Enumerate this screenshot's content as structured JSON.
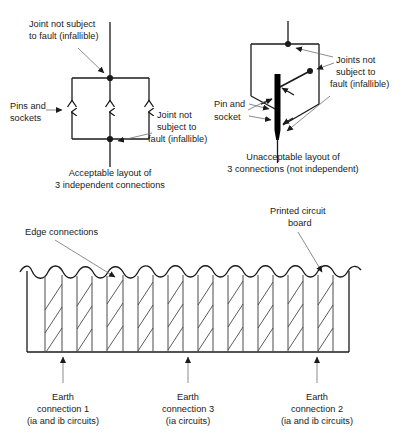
{
  "figure": {
    "line_color": "#1a1a1a",
    "leader_color": "#6f6f6f",
    "hatch_color": "#4a4a4a",
    "background": "#ffffff"
  },
  "diagram_left": {
    "name": "acceptable-layout",
    "caption_line1": "Acceptable layout of",
    "caption_line2": "3 independent connections",
    "label_top": {
      "line1": "Joint not subject",
      "line2": "to fault (infallible)"
    },
    "label_left": {
      "line1": "Pins and",
      "line2": "sockets"
    },
    "label_bottom_right": {
      "line1": "Joint not",
      "line2": "subject to",
      "line3": "fault (infallible)"
    },
    "connection_count": 3
  },
  "diagram_right": {
    "name": "unacceptable-layout",
    "caption_line1": "Unacceptable layout of",
    "caption_line2": "3 connections (not independent)",
    "label_right": {
      "line1": "Joints not",
      "line2": "subject to",
      "line3": "fault (infallible)"
    },
    "label_left": {
      "line1": "Pin and",
      "line2": "socket"
    },
    "connection_count": 3,
    "common_bar_color": "#000000"
  },
  "diagram_pcb": {
    "name": "printed-circuit-board",
    "label_edge_connections": "Edge connections",
    "label_board": {
      "line1": "Printed circuit",
      "line2": "board"
    },
    "earth_connections": [
      {
        "id": "earth-connection-1",
        "line1": "Earth",
        "line2": "connection 1",
        "line3": "(ia and ib circuits)",
        "x": 63
      },
      {
        "id": "earth-connection-3",
        "line1": "Earth",
        "line2": "connection 3",
        "line3": "(ia circuits)",
        "x": 188
      },
      {
        "id": "earth-connection-2",
        "line1": "Earth",
        "line2": "connection 2",
        "line3": "(ia and ib circuits)",
        "x": 317
      }
    ],
    "strip_count": 19
  }
}
